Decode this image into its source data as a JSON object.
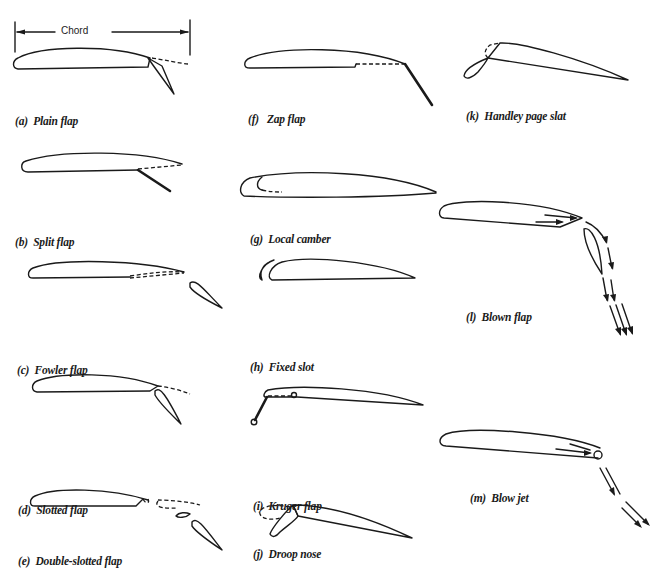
{
  "figure": {
    "type": "airfoil high-lift device diagram",
    "dimension_label": "Chord",
    "colors": {
      "ink": "#1a1a1a",
      "background": "#ffffff"
    }
  },
  "panels": [
    {
      "id": "a",
      "label": "(a)  Plain flap"
    },
    {
      "id": "b",
      "label": "(b)  Split flap"
    },
    {
      "id": "c",
      "label": "(c)  Fowler flap"
    },
    {
      "id": "d",
      "label": "(d)  Slotted flap"
    },
    {
      "id": "e",
      "label": "(e)  Double-slotted flap"
    },
    {
      "id": "f",
      "label": "(f)   Zap flap"
    },
    {
      "id": "g",
      "label": "(g)  Local camber"
    },
    {
      "id": "h",
      "label": "(h)  Fixed slot"
    },
    {
      "id": "i",
      "label": "(i)  Kruger flap"
    },
    {
      "id": "j",
      "label": "(j)  Droop nose"
    },
    {
      "id": "k",
      "label": "(k)  Handley page slat"
    },
    {
      "id": "l",
      "label": "(l)  Blown flap"
    },
    {
      "id": "m",
      "label": "(m)  Blow jet"
    }
  ]
}
